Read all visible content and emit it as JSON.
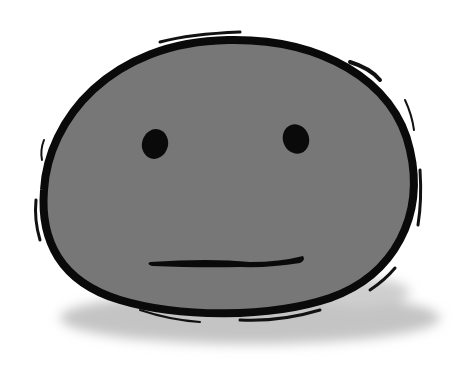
{
  "illustration": {
    "subject": "gray blob face with neutral expression",
    "colors": {
      "background": "#ffffff",
      "fill": "#777777",
      "outline": "#0a0a0a",
      "shadow": "#bdbdbd"
    }
  }
}
